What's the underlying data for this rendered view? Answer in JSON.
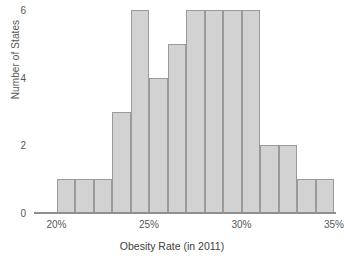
{
  "chart_data": {
    "type": "bar",
    "title": "",
    "subtitle": "",
    "xlabel": "Obesity Rate (in 2011)",
    "ylabel": "Number of States",
    "grid": false,
    "legend": null,
    "legend_position": "none",
    "bin_width": 1,
    "bin_unit": "%",
    "xlim": [
      19,
      35
    ],
    "ylim": [
      0,
      6
    ],
    "x_tick_values": [
      20,
      25,
      30,
      35
    ],
    "x_tick_labels": [
      "20%",
      "25%",
      "30%",
      "35%"
    ],
    "y_tick_values": [
      0,
      2,
      4,
      6
    ],
    "y_tick_labels": [
      "0",
      "2",
      "4",
      "6"
    ],
    "bin_starts": [
      20,
      21,
      22,
      23,
      24,
      25,
      26,
      27,
      28,
      29,
      30,
      31,
      32,
      33,
      34
    ],
    "categories": [
      "20%-21%",
      "21%-22%",
      "22%-23%",
      "23%-24%",
      "24%-25%",
      "25%-26%",
      "26%-27%",
      "27%-28%",
      "28%-29%",
      "29%-30%",
      "30%-31%",
      "31%-32%",
      "32%-33%",
      "33%-34%",
      "34%-35%"
    ],
    "values": [
      1,
      1,
      1,
      3,
      6,
      4,
      5,
      6,
      6,
      6,
      6,
      2,
      2,
      1,
      1
    ],
    "total": 50,
    "colors": {
      "bar_fill": "#d2d2d2",
      "bar_border": "#9a9a9a",
      "axis": "#8f8f8f",
      "tick_text": "#565656",
      "axis_title": "#3d3d3d",
      "background": "#ffffff"
    }
  }
}
